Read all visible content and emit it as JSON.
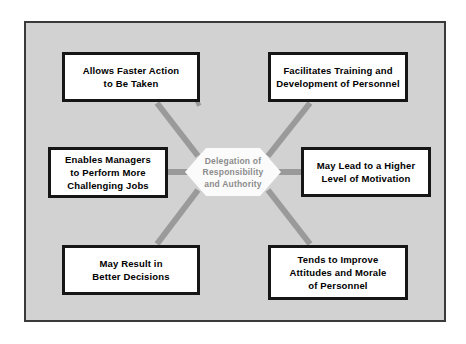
{
  "diagram": {
    "type": "hub-and-spoke",
    "title": "Delegation of Responsibility and Authority",
    "background_color": "#d2d2d2",
    "frame_border_color": "#3a3a3a",
    "connector_color": "#9a9a9a",
    "box_border_color": "#161616",
    "box_fill_color": "#ffffff",
    "hub_fill_color": "#fbfbfb",
    "hub_text_color": "#8c8c8c",
    "hub": {
      "lines": [
        "Delegation of",
        "Responsibility",
        "and Authority"
      ]
    },
    "nodes": [
      {
        "id": "top-left",
        "position": "top-left",
        "lines": [
          "Allows Faster Action",
          "to Be Taken"
        ]
      },
      {
        "id": "top-right",
        "position": "top-right",
        "lines": [
          "Facilitates Training and",
          "Development of Personnel"
        ]
      },
      {
        "id": "middle-left",
        "position": "middle-left",
        "lines": [
          "Enables Managers",
          "to Perform More",
          "Challenging Jobs"
        ]
      },
      {
        "id": "middle-right",
        "position": "middle-right",
        "lines": [
          "May Lead to a Higher",
          "Level of Motivation"
        ]
      },
      {
        "id": "bottom-left",
        "position": "bottom-left",
        "lines": [
          "May Result in",
          "Better Decisions"
        ]
      },
      {
        "id": "bottom-right",
        "position": "bottom-right",
        "lines": [
          "Tends to Improve",
          "Attitudes and Morale",
          "of Personnel"
        ]
      }
    ]
  }
}
